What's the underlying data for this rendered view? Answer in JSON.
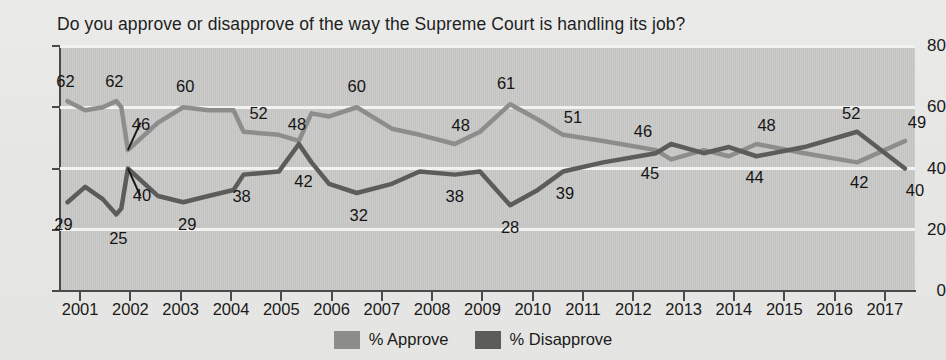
{
  "chart_data": {
    "type": "line",
    "title": "Do you approve or disapprove of the way the Supreme Court is handling its job?",
    "xlabel": "",
    "ylabel": "",
    "ylim": [
      0,
      80
    ],
    "xlim": [
      2000.6,
      2017.6
    ],
    "grid": true,
    "legend_position": "bottom",
    "yticks": [
      "0",
      "20",
      "40",
      "60",
      "80"
    ],
    "xticks": [
      "2001",
      "2002",
      "2003",
      "2004",
      "2005",
      "2006",
      "2007",
      "2008",
      "2009",
      "2010",
      "2011",
      "2012",
      "2013",
      "2014",
      "2015",
      "2016",
      "2017"
    ],
    "series": [
      {
        "name": "% Approve",
        "color": "#8d8d8b",
        "points": [
          {
            "x": 2000.75,
            "y": 62
          },
          {
            "x": 2001.1,
            "y": 59
          },
          {
            "x": 2001.45,
            "y": 60
          },
          {
            "x": 2001.72,
            "y": 62
          },
          {
            "x": 2001.82,
            "y": 60
          },
          {
            "x": 2001.95,
            "y": 46
          },
          {
            "x": 2002.55,
            "y": 55
          },
          {
            "x": 2003.05,
            "y": 60
          },
          {
            "x": 2003.55,
            "y": 59
          },
          {
            "x": 2004.05,
            "y": 59
          },
          {
            "x": 2004.25,
            "y": 52
          },
          {
            "x": 2004.95,
            "y": 51
          },
          {
            "x": 2005.35,
            "y": 49
          },
          {
            "x": 2005.6,
            "y": 58
          },
          {
            "x": 2005.95,
            "y": 57
          },
          {
            "x": 2006.5,
            "y": 60
          },
          {
            "x": 2007.2,
            "y": 53
          },
          {
            "x": 2007.75,
            "y": 51
          },
          {
            "x": 2008.45,
            "y": 48
          },
          {
            "x": 2008.95,
            "y": 52
          },
          {
            "x": 2009.55,
            "y": 61
          },
          {
            "x": 2010.1,
            "y": 56
          },
          {
            "x": 2010.6,
            "y": 51
          },
          {
            "x": 2011.4,
            "y": 49
          },
          {
            "x": 2012.45,
            "y": 46
          },
          {
            "x": 2012.75,
            "y": 43
          },
          {
            "x": 2013.4,
            "y": 46
          },
          {
            "x": 2013.9,
            "y": 44
          },
          {
            "x": 2014.45,
            "y": 48
          },
          {
            "x": 2015.4,
            "y": 45
          },
          {
            "x": 2016.45,
            "y": 42
          },
          {
            "x": 2017.4,
            "y": 49
          }
        ],
        "labels": [
          {
            "x": 2000.75,
            "y": 62,
            "text": "62"
          },
          {
            "x": 2001.72,
            "y": 62,
            "text": "62"
          },
          {
            "x": 2001.95,
            "y": 46,
            "text": "46"
          },
          {
            "x": 2003.05,
            "y": 60,
            "text": "60"
          },
          {
            "x": 2004.25,
            "y": 52,
            "text": "52"
          },
          {
            "x": 2006.5,
            "y": 60,
            "text": "60"
          },
          {
            "x": 2008.45,
            "y": 48,
            "text": "48"
          },
          {
            "x": 2009.55,
            "y": 61,
            "text": "61"
          },
          {
            "x": 2010.6,
            "y": 51,
            "text": "51"
          },
          {
            "x": 2012.45,
            "y": 46,
            "text": "46"
          },
          {
            "x": 2014.45,
            "y": 48,
            "text": "48"
          },
          {
            "x": 2016.45,
            "y": 42,
            "text": "42"
          },
          {
            "x": 2017.4,
            "y": 49,
            "text": "49"
          }
        ]
      },
      {
        "name": "% Disapprove",
        "color": "#5c5c5a",
        "points": [
          {
            "x": 2000.75,
            "y": 29
          },
          {
            "x": 2001.1,
            "y": 34
          },
          {
            "x": 2001.45,
            "y": 30
          },
          {
            "x": 2001.72,
            "y": 25
          },
          {
            "x": 2001.82,
            "y": 27
          },
          {
            "x": 2001.95,
            "y": 40
          },
          {
            "x": 2002.55,
            "y": 31
          },
          {
            "x": 2003.05,
            "y": 29
          },
          {
            "x": 2003.55,
            "y": 31
          },
          {
            "x": 2004.05,
            "y": 33
          },
          {
            "x": 2004.25,
            "y": 38
          },
          {
            "x": 2004.95,
            "y": 39
          },
          {
            "x": 2005.35,
            "y": 48
          },
          {
            "x": 2005.6,
            "y": 42
          },
          {
            "x": 2005.95,
            "y": 35
          },
          {
            "x": 2006.5,
            "y": 32
          },
          {
            "x": 2007.2,
            "y": 35
          },
          {
            "x": 2007.75,
            "y": 39
          },
          {
            "x": 2008.45,
            "y": 38
          },
          {
            "x": 2008.95,
            "y": 39
          },
          {
            "x": 2009.55,
            "y": 28
          },
          {
            "x": 2010.1,
            "y": 33
          },
          {
            "x": 2010.6,
            "y": 39
          },
          {
            "x": 2011.4,
            "y": 42
          },
          {
            "x": 2012.45,
            "y": 45
          },
          {
            "x": 2012.75,
            "y": 48
          },
          {
            "x": 2013.4,
            "y": 45
          },
          {
            "x": 2013.9,
            "y": 47
          },
          {
            "x": 2014.45,
            "y": 44
          },
          {
            "x": 2015.4,
            "y": 47
          },
          {
            "x": 2016.45,
            "y": 52
          },
          {
            "x": 2017.4,
            "y": 40
          }
        ],
        "labels": [
          {
            "x": 2000.75,
            "y": 29,
            "text": "29"
          },
          {
            "x": 2001.72,
            "y": 25,
            "text": "25"
          },
          {
            "x": 2001.95,
            "y": 40,
            "text": "40"
          },
          {
            "x": 2003.05,
            "y": 29,
            "text": "29"
          },
          {
            "x": 2004.25,
            "y": 38,
            "text": "38"
          },
          {
            "x": 2005.35,
            "y": 48,
            "text": "48"
          },
          {
            "x": 2005.6,
            "y": 42,
            "text": "42"
          },
          {
            "x": 2006.5,
            "y": 32,
            "text": "32"
          },
          {
            "x": 2008.45,
            "y": 38,
            "text": "38"
          },
          {
            "x": 2009.55,
            "y": 28,
            "text": "28"
          },
          {
            "x": 2010.6,
            "y": 39,
            "text": "39"
          },
          {
            "x": 2012.45,
            "y": 45,
            "text": "45"
          },
          {
            "x": 2014.45,
            "y": 44,
            "text": "44"
          },
          {
            "x": 2016.45,
            "y": 52,
            "text": "52"
          },
          {
            "x": 2017.4,
            "y": 40,
            "text": "40"
          }
        ]
      }
    ],
    "label_offsets": {
      "approve": [
        {
          "dx": -2,
          "dy": -20
        },
        {
          "dx": -2,
          "dy": -20
        },
        {
          "dx": 13,
          "dy": -26
        },
        {
          "dx": 2,
          "dy": -21
        },
        {
          "dx": 15,
          "dy": -19
        },
        {
          "dx": 0,
          "dy": -21
        },
        {
          "dx": 6,
          "dy": -19
        },
        {
          "dx": -4,
          "dy": -21
        },
        {
          "dx": 10,
          "dy": -18
        },
        {
          "dx": -13,
          "dy": -19
        },
        {
          "dx": 10,
          "dy": -19
        },
        {
          "dx": 2,
          "dy": 20
        },
        {
          "dx": 12,
          "dy": -19
        }
      ],
      "disapprove": [
        {
          "dx": -4,
          "dy": 22
        },
        {
          "dx": 2,
          "dy": 24
        },
        {
          "dx": 14,
          "dy": 26
        },
        {
          "dx": 4,
          "dy": 22
        },
        {
          "dx": -2,
          "dy": 21
        },
        {
          "dx": -2,
          "dy": -20
        },
        {
          "dx": -8,
          "dy": 19
        },
        {
          "dx": 2,
          "dy": 22
        },
        {
          "dx": 0,
          "dy": 21
        },
        {
          "dx": 0,
          "dy": 22
        },
        {
          "dx": 2,
          "dy": 21
        },
        {
          "dx": -6,
          "dy": 20
        },
        {
          "dx": -2,
          "dy": 21
        },
        {
          "dx": -6,
          "dy": -19
        },
        {
          "dx": 10,
          "dy": 21
        }
      ]
    },
    "background": {
      "page": "#e9e9e7",
      "plot": "#c9c9c7",
      "gridline": "#f2f2f0",
      "axis": "#4a4a4a"
    }
  },
  "legend": {
    "items": [
      {
        "label": "% Approve",
        "color": "#8d8d8b"
      },
      {
        "label": "% Disapprove",
        "color": "#5c5c5a"
      }
    ]
  }
}
